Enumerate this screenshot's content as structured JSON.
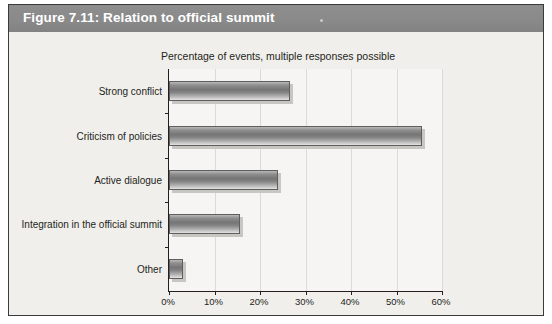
{
  "figure": {
    "title": "Figure 7.11: Relation to official summit"
  },
  "chart_data": {
    "type": "bar",
    "orientation": "horizontal",
    "title": "Percentage of events, multiple responses possible",
    "subtitle": "Percentage of events, multiple responses possible",
    "categories": [
      "Strong conflict",
      "Criticism of policies",
      "Active dialogue",
      "Integration in the official summit",
      "Other"
    ],
    "values": [
      26.5,
      55.5,
      24.0,
      15.5,
      3.0
    ],
    "xlabel": "",
    "ylabel": "",
    "xlim": [
      0,
      60
    ],
    "xticks": [
      0,
      10,
      20,
      30,
      40,
      50,
      60
    ],
    "xtick_labels": [
      "0%",
      "10%",
      "20%",
      "30%",
      "40%",
      "50%",
      "60%"
    ],
    "grid": "vertical",
    "legend": "none",
    "bar_color": "#8e8e8e",
    "bar_edge_color": "#5e5e5e",
    "shadow_color": "#c8c6c2",
    "plot_bg": "#f6f5f3",
    "panel_bg": "#f1efec",
    "header_bg": "#8a8a8a",
    "header_text_color": "#ffffff",
    "axis_color": "#231f20"
  }
}
